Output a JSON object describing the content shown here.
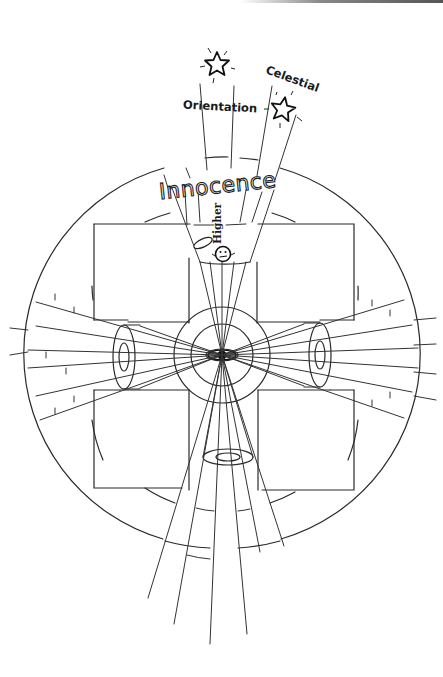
{
  "diagram": {
    "labels": {
      "orientation": "Orientation",
      "celestial": "Celestial",
      "innocence": "Innocence",
      "higher": "Higher"
    },
    "icons": [
      "star-icon",
      "star-icon",
      "halo-icon",
      "face-icon",
      "eye-icon"
    ],
    "colors": {
      "ink": "#2a2a2a",
      "background": "#ffffff"
    }
  }
}
